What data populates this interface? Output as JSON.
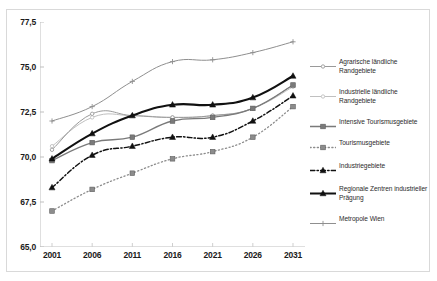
{
  "title": "",
  "chart_data": {
    "type": "line",
    "title": "",
    "subtitle": "",
    "xlabel": "",
    "ylabel": "",
    "x": [
      2001,
      2006,
      2011,
      2016,
      2021,
      2026,
      2031
    ],
    "xticklabels": [
      "2001",
      "2006",
      "2011",
      "2016",
      "2021",
      "2026",
      "2031"
    ],
    "yticks": [
      65.0,
      67.5,
      70.0,
      72.5,
      75.0,
      77.5
    ],
    "yticklabels": [
      "65,0",
      "67,5",
      "70,0",
      "72,5",
      "75,0",
      "77,5"
    ],
    "ylim": [
      65.0,
      77.5
    ],
    "xlim": [
      2001,
      2031
    ],
    "grid": false,
    "legend_position": "right",
    "series": [
      {
        "name": "Agrarische ländliche Randgebiete",
        "values": [
          70.4,
          72.4,
          72.3,
          72.2,
          72.3,
          72.7,
          74.0
        ],
        "color": "#9a9a9a",
        "marker": "dot",
        "dash": "solid",
        "width": 1
      },
      {
        "name": "Industrielle ländliche Randgebiete",
        "values": [
          70.6,
          72.2,
          72.3,
          72.2,
          72.3,
          72.7,
          73.9
        ],
        "color": "#c0c0c0",
        "marker": "dot",
        "dash": "solid",
        "width": 1
      },
      {
        "name": "Intensive Tourismusgebiete",
        "values": [
          69.8,
          70.8,
          71.1,
          72.0,
          72.2,
          72.7,
          74.0
        ],
        "color": "#7a7a7a",
        "marker": "square",
        "dash": "solid",
        "width": 1.3
      },
      {
        "name": "Tourismusgebiete",
        "values": [
          67.0,
          68.2,
          69.1,
          69.9,
          70.3,
          71.1,
          72.8
        ],
        "color": "#8c8c8c",
        "marker": "square",
        "dash": "dotted",
        "width": 1.3
      },
      {
        "name": "Industriegebiete",
        "values": [
          68.3,
          70.1,
          70.6,
          71.1,
          71.1,
          72.0,
          73.4
        ],
        "color": "#111111",
        "marker": "triangle",
        "dash": "dashdot",
        "width": 1.5
      },
      {
        "name": "Regionale Zentren industrieller Prägung",
        "values": [
          69.9,
          71.3,
          72.3,
          72.9,
          72.9,
          73.3,
          74.5
        ],
        "color": "#111111",
        "marker": "triangle",
        "dash": "solid",
        "width": 2.1
      },
      {
        "name": "Metropole Wien",
        "values": [
          72.0,
          72.8,
          74.2,
          75.3,
          75.4,
          75.8,
          76.4
        ],
        "color": "#8f8f8f",
        "marker": "plus",
        "dash": "solid",
        "width": 1
      }
    ]
  },
  "legend": {
    "items": [
      {
        "label": "Agrarische ländliche Randgebiete"
      },
      {
        "label": "Industrielle ländliche Randgebiete"
      },
      {
        "label": "Intensive Tourismusgebiete"
      },
      {
        "label": "Tourismusgebiete"
      },
      {
        "label": "Industriegebiete"
      },
      {
        "label": "Regionale Zentren industrieller Prägung"
      },
      {
        "label": "Metropole Wien"
      }
    ]
  }
}
